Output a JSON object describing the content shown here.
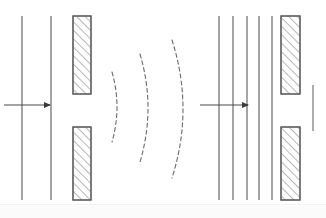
{
  "figure": {
    "background_color": "#ffffff",
    "stroke_color": "#555555",
    "hatch_color": "#777777",
    "barrier_fill": "#ffffff",
    "width": 326,
    "height": 218
  },
  "left_panel": {
    "label": "incident-plane-waves",
    "wavefronts": [
      {
        "name": "wavefront-1",
        "x": 22,
        "y_top": 16,
        "y_bottom": 200
      },
      {
        "name": "wavefront-2",
        "x": 51,
        "y_top": 16,
        "y_bottom": 200
      }
    ],
    "propagation_arrow": {
      "name": "propagation-direction-arrow",
      "x_start": 4,
      "x_end": 54,
      "y": 105,
      "direction": "right"
    },
    "barrier": {
      "name": "single-slit-barrier",
      "upper_block": {
        "x": 73,
        "y": 16,
        "width": 18,
        "height": 78
      },
      "lower_block": {
        "x": 73,
        "y": 127,
        "width": 18,
        "height": 73
      },
      "slit_gap": {
        "y_top": 94,
        "y_bottom": 127,
        "aperture": 33
      }
    },
    "diffracted_arcs": [
      {
        "name": "diffracted-arc-1",
        "apex_x": 117,
        "y_top": 72,
        "y_bottom": 142,
        "bulge": 5
      },
      {
        "name": "diffracted-arc-2",
        "apex_x": 148,
        "y_top": 54,
        "y_bottom": 162,
        "bulge": 8
      },
      {
        "name": "diffracted-arc-3",
        "apex_x": 183,
        "y_top": 40,
        "y_bottom": 178,
        "bulge": 11
      }
    ]
  },
  "right_panel": {
    "label": "incident-plane-waves-wide-slit",
    "wavefronts": [
      {
        "name": "wavefront-1",
        "x": 219,
        "y_top": 16,
        "y_bottom": 200
      },
      {
        "name": "wavefront-2",
        "x": 233,
        "y_top": 16,
        "y_bottom": 200
      },
      {
        "name": "wavefront-3",
        "x": 247,
        "y_top": 16,
        "y_bottom": 200
      },
      {
        "name": "wavefront-4",
        "x": 259,
        "y_top": 16,
        "y_bottom": 200
      },
      {
        "name": "wavefront-5",
        "x": 272,
        "y_top": 16,
        "y_bottom": 200
      }
    ],
    "propagation_arrow": {
      "name": "propagation-direction-arrow",
      "x_start": 200,
      "x_end": 252,
      "y": 105,
      "direction": "right"
    },
    "barrier": {
      "name": "single-slit-barrier",
      "upper_block": {
        "x": 281,
        "y": 16,
        "width": 19,
        "height": 78
      },
      "lower_block": {
        "x": 281,
        "y": 127,
        "width": 19,
        "height": 73
      },
      "slit_gap": {
        "y_top": 94,
        "y_bottom": 127,
        "aperture": 33
      }
    },
    "transmitted_wavefronts": [
      {
        "name": "transmitted-wavefront-1",
        "x": 313,
        "y_top": 85,
        "y_bottom": 131
      }
    ]
  },
  "legend": {
    "items": []
  }
}
